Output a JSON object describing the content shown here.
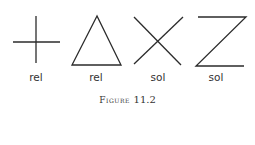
{
  "figure": {
    "caption_word": "Figure",
    "caption_number": "11.2",
    "shapes": [
      {
        "name": "cross",
        "label": "rel"
      },
      {
        "name": "triangle",
        "label": "rel"
      },
      {
        "name": "x-shape",
        "label": "sol"
      },
      {
        "name": "z-shape",
        "label": "sol"
      }
    ]
  }
}
